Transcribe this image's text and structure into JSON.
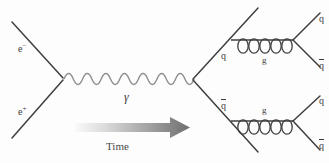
{
  "figure": {
    "kind": "feynman-diagram",
    "title": "",
    "background_color": "#fdfdfd",
    "line_color": "#3f3f3f",
    "wave_color": "#8a8a8a",
    "label_color": "#3a3a3a"
  },
  "labels": {
    "electron": "e",
    "electron_charge": "−",
    "positron": "e",
    "positron_charge": "+",
    "photon": "γ",
    "quark": "q",
    "antiquark": "q",
    "gluon": "g",
    "time": "Time"
  },
  "particles": {
    "incoming": [
      {
        "name": "electron",
        "label": "e",
        "charge": "−",
        "position": "upper-left"
      },
      {
        "name": "positron",
        "label": "e",
        "charge": "+",
        "position": "lower-left"
      }
    ],
    "propagator": {
      "name": "photon",
      "label": "γ",
      "style": "wavy",
      "wave_count": 7
    },
    "intermediate": [
      {
        "name": "quark",
        "label": "q",
        "position": "upper-right-branch"
      },
      {
        "name": "antiquark",
        "label": "q",
        "overbar": true,
        "position": "lower-right-branch"
      }
    ],
    "gluons": [
      {
        "name": "gluon-upper",
        "label": "g",
        "style": "coiled",
        "loop_count": 5
      },
      {
        "name": "gluon-lower",
        "label": "g",
        "style": "coiled",
        "loop_count": 5
      }
    ],
    "outgoing": [
      {
        "name": "quark",
        "label": "q",
        "overbar": false,
        "position": "top-right-1"
      },
      {
        "name": "antiquark",
        "label": "q",
        "overbar": true,
        "position": "top-right-2"
      },
      {
        "name": "quark",
        "label": "q",
        "overbar": false,
        "position": "bottom-right-1"
      },
      {
        "name": "antiquark",
        "label": "q",
        "overbar": true,
        "position": "bottom-right-2"
      }
    ]
  },
  "time_arrow": {
    "label": "Time",
    "direction": "left-to-right",
    "gradient_from": "#f2f2f2",
    "gradient_to": "#6e6e6e"
  }
}
